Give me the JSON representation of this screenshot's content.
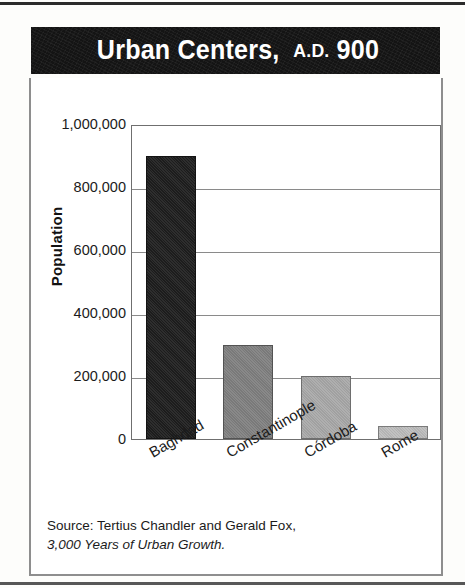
{
  "title": {
    "main": "Urban Centers,",
    "era": "A.D.",
    "year": "900",
    "band_color": "#141414",
    "text_color": "#ffffff"
  },
  "source": {
    "line1": "Source: Tertius Chandler and Gerald Fox,",
    "line2": "3,000 Years of Urban Growth."
  },
  "axis": {
    "ylabel": "Population",
    "yticks": [
      "1,000,000",
      "800,000",
      "600,000",
      "400,000",
      "200,000",
      "0"
    ]
  },
  "chart_data": {
    "type": "bar",
    "title": "Urban Centers, A.D. 900",
    "xlabel": "",
    "ylabel": "Population",
    "categories": [
      "Baghdad",
      "Constantinople",
      "Córdoba",
      "Rome"
    ],
    "values": [
      900000,
      300000,
      200000,
      40000
    ],
    "bar_colors": [
      "#1e1e1e",
      "#808080",
      "#a9a9a9",
      "#bdbdbd"
    ],
    "ylim": [
      0,
      1000000
    ],
    "ytick_values": [
      0,
      200000,
      400000,
      600000,
      800000,
      1000000
    ],
    "grid": true,
    "legend": "none",
    "xtick_rotation": -30,
    "source": "Source: Tertius Chandler and Gerald Fox, 3,000 Years of Urban Growth."
  }
}
